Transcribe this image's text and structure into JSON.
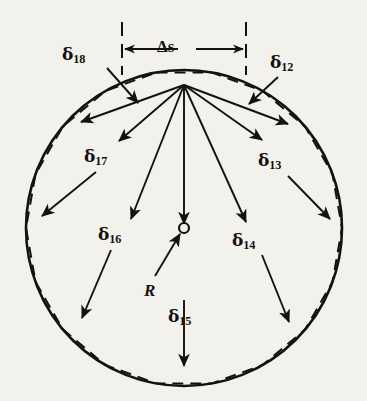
{
  "figure": {
    "background_color": "#f3f1ec",
    "ink_color": "#14120f"
  },
  "geometry": {
    "circle": {
      "center_x": 184,
      "center_y": 228,
      "radius": 158,
      "stroke_width": 2.6
    },
    "polygon": {
      "sides": 18,
      "vertex_count": 18,
      "dash_pattern": "11 7",
      "stroke_width": 2.0,
      "start_angle_deg": -100
    },
    "apex": {
      "x": 184,
      "y": 85
    },
    "center_marker": {
      "x": 184,
      "y": 228,
      "radius": 5.0
    }
  },
  "dimension": {
    "label": "Δs",
    "left_tick_x": 122,
    "right_tick_x": 246,
    "tick_top_y": 22,
    "tick_bottom_y": 75,
    "arrow_y": 49
  },
  "labels": [
    {
      "name": "delta-18",
      "glyph": "δ",
      "subscript": "18",
      "x": 62,
      "y": 46
    },
    {
      "name": "delta-12",
      "glyph": "δ",
      "subscript": "12",
      "x": 270,
      "y": 54
    },
    {
      "name": "delta-17",
      "glyph": "δ",
      "subscript": "17",
      "x": 84,
      "y": 148
    },
    {
      "name": "delta-13",
      "glyph": "δ",
      "subscript": "13",
      "x": 258,
      "y": 152
    },
    {
      "name": "delta-16",
      "glyph": "δ",
      "subscript": "16",
      "x": 98,
      "y": 226
    },
    {
      "name": "delta-14",
      "glyph": "δ",
      "subscript": "14",
      "x": 232,
      "y": 232
    },
    {
      "name": "delta-15",
      "glyph": "δ",
      "subscript": "15",
      "x": 168,
      "y": 308
    },
    {
      "name": "radius",
      "glyph": "R",
      "subscript": "",
      "x": 144,
      "y": 282
    }
  ],
  "leaders": [
    {
      "name": "leader-delta-18",
      "x1": 107,
      "y1": 68,
      "x2": 138,
      "y2": 103
    },
    {
      "name": "leader-delta-12",
      "x1": 278,
      "y1": 77,
      "x2": 249,
      "y2": 104
    },
    {
      "name": "leader-delta-17-upper",
      "x1": 184,
      "y1": 85,
      "x2": 119,
      "y2": 141
    },
    {
      "name": "leader-delta-17-lower",
      "x1": 96,
      "y1": 172,
      "x2": 42,
      "y2": 216
    },
    {
      "name": "leader-delta-13-upper",
      "x1": 184,
      "y1": 85,
      "x2": 262,
      "y2": 140
    },
    {
      "name": "leader-delta-13-lower",
      "x1": 288,
      "y1": 176,
      "x2": 330,
      "y2": 219
    },
    {
      "name": "leader-delta-16-upper",
      "x1": 184,
      "y1": 85,
      "x2": 131,
      "y2": 219
    },
    {
      "name": "leader-delta-16-lower",
      "x1": 111,
      "y1": 250,
      "x2": 82,
      "y2": 318
    },
    {
      "name": "leader-delta-14-upper",
      "x1": 184,
      "y1": 85,
      "x2": 246,
      "y2": 222
    },
    {
      "name": "leader-delta-14-lower",
      "x1": 262,
      "y1": 255,
      "x2": 289,
      "y2": 322
    },
    {
      "name": "leader-delta-15-upper",
      "x1": 184,
      "y1": 85,
      "x2": 184,
      "y2": 224
    },
    {
      "name": "leader-delta-15-lower",
      "x1": 184,
      "y1": 300,
      "x2": 184,
      "y2": 366
    },
    {
      "name": "leader-radius",
      "x1": 155,
      "y1": 276,
      "x2": 180,
      "y2": 234
    },
    {
      "name": "leader-delta-17-fan",
      "x1": 184,
      "y1": 85,
      "x2": 81,
      "y2": 122
    },
    {
      "name": "leader-delta-13-fan",
      "x1": 184,
      "y1": 85,
      "x2": 288,
      "y2": 124
    }
  ],
  "notes": {
    "circle_style": "solid",
    "polygon_style": "dashed",
    "delta_meaning": "gap between chord and arc",
    "delta_count": 7,
    "delta_names": [
      "δ12",
      "δ13",
      "δ14",
      "δ15",
      "δ16",
      "δ17",
      "δ18"
    ]
  }
}
